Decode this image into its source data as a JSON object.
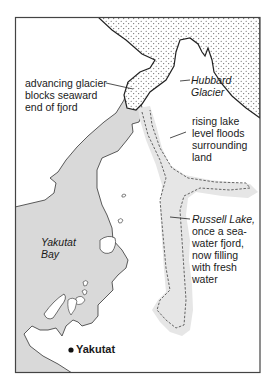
{
  "map": {
    "colors": {
      "background": "#ffffff",
      "water_fill": "#d9d9d9",
      "lake_halo": "#e6e6e6",
      "glacier_fill": "#ffffff",
      "glacier_dots": "#555555",
      "outline": "#333333",
      "frame": "#444444"
    },
    "labels": {
      "glacier_note": [
        "advancing glacier",
        "blocks seaward",
        "end of fjord"
      ],
      "glacier_name": [
        "Hubbard",
        "Glacier"
      ],
      "flood_note": [
        "rising lake",
        "level floods",
        "surrounding",
        "land"
      ],
      "lake_name": "Russell Lake,",
      "lake_note": [
        "once a sea-",
        "water fjord,",
        "now filling",
        "with fresh",
        "water"
      ],
      "bay_name": [
        "Yakutat",
        "Bay"
      ],
      "town_name": "Yakutat"
    },
    "features": [
      {
        "name": "Hubbard Glacier",
        "kind": "glacier",
        "style": "stippled"
      },
      {
        "name": "Russell Lake",
        "kind": "lake",
        "style": "dashed-outline-with-halo"
      },
      {
        "name": "Yakutat Bay",
        "kind": "bay",
        "style": "gray-fill"
      },
      {
        "name": "Yakutat",
        "kind": "town",
        "style": "dot"
      }
    ]
  }
}
